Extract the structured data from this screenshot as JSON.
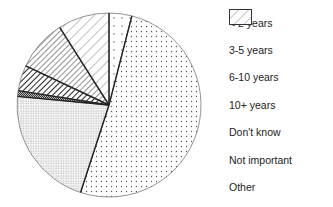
{
  "chart_data": {
    "type": "pie",
    "title": "",
    "categories": [
      "< 2 years",
      "3-5 years",
      "6-10 years",
      "10+ years",
      "Don't know",
      "Not important",
      "Other"
    ],
    "values": [
      4,
      51,
      21.5,
      1,
      4.5,
      9,
      9
    ],
    "unit": "%",
    "start_angle": "12 o'clock",
    "direction": "clockwise",
    "legend_position": "right",
    "patterns": [
      "sparse-dots",
      "dots",
      "fine-dots",
      "dense-crosshatch",
      "heavy-diagonal",
      "medium-diagonal",
      "light-diagonal"
    ]
  },
  "legend": {
    "items": [
      {
        "label": "< 2 years"
      },
      {
        "label": "3-5 years"
      },
      {
        "label": "6-10 years"
      },
      {
        "label": "10+ years"
      },
      {
        "label": "Don't know"
      },
      {
        "label": "Not important"
      },
      {
        "label": "Other"
      }
    ]
  }
}
